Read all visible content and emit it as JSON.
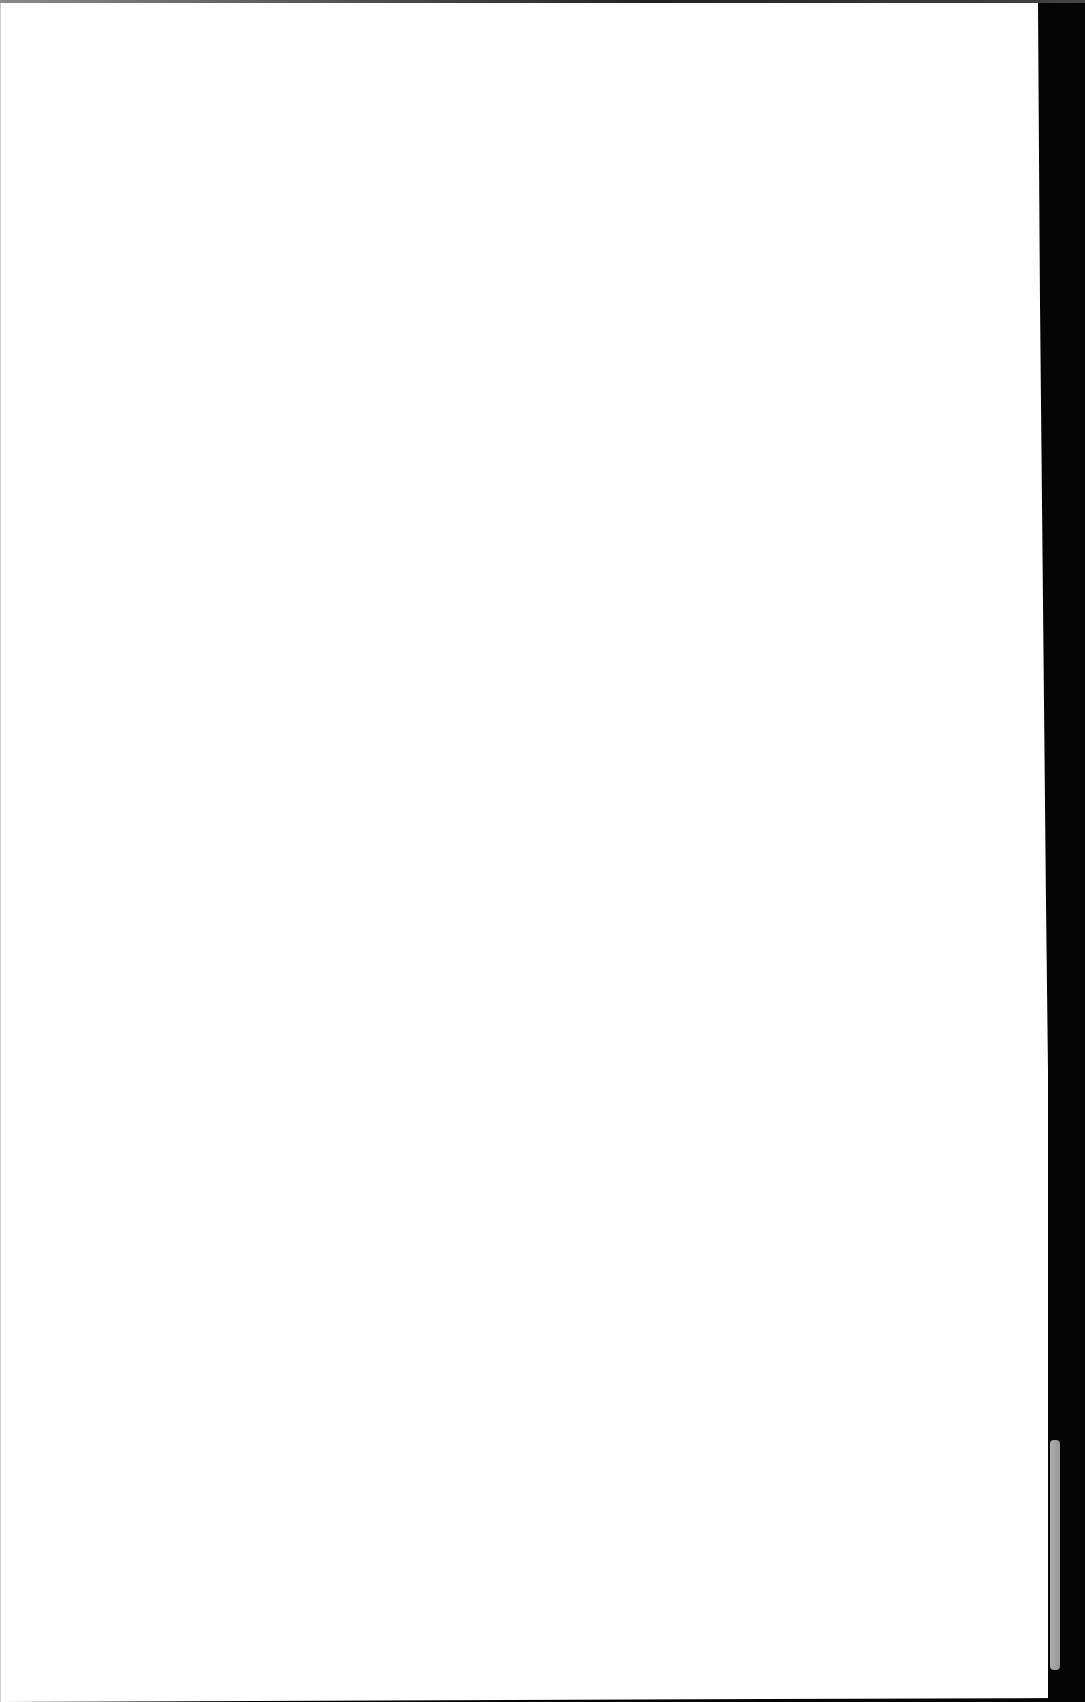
{
  "document": {
    "type": "scanned-page",
    "content": "",
    "colors": {
      "paper": "#ffffff",
      "scanner_background": "#050505"
    }
  }
}
